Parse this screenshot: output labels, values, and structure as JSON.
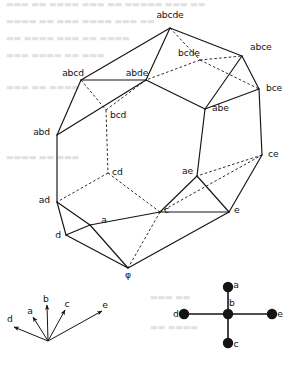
{
  "figure": {
    "name": "graph-associahedron-diagram",
    "caption": "",
    "colors": {
      "ink": "#141414",
      "solid_edge": "#141414",
      "hidden_edge": "#141414",
      "node_fill": "#141414",
      "background": "#ffffff",
      "scan_bleed": "#c9c9c9"
    }
  },
  "polytope": {
    "name": "subset-lattice-polytope",
    "empty_set_symbol": "φ",
    "vertices": [
      {
        "id": "abcde",
        "label": "abcde",
        "x": 170,
        "y": 28,
        "lx": 170,
        "ly": 18,
        "anchor": "middle",
        "hidden": false
      },
      {
        "id": "abce",
        "label": "abce",
        "x": 242,
        "y": 56,
        "lx": 250,
        "ly": 50,
        "anchor": "start",
        "hidden": false
      },
      {
        "id": "bcde",
        "label": "bcde",
        "x": 200,
        "y": 60,
        "lx": 189,
        "ly": 56,
        "anchor": "middle",
        "hidden": true
      },
      {
        "id": "abcd",
        "label": "abcd",
        "x": 81,
        "y": 80,
        "lx": 73,
        "ly": 76,
        "anchor": "middle",
        "hidden": false
      },
      {
        "id": "abde",
        "label": "abde",
        "x": 146,
        "y": 80,
        "lx": 137,
        "ly": 76,
        "anchor": "middle",
        "hidden": false
      },
      {
        "id": "bce",
        "label": "bce",
        "x": 259,
        "y": 89,
        "lx": 266,
        "ly": 91,
        "anchor": "start",
        "hidden": false
      },
      {
        "id": "abe",
        "label": "abe",
        "x": 205,
        "y": 109,
        "lx": 212,
        "ly": 111,
        "anchor": "start",
        "hidden": false
      },
      {
        "id": "bcd",
        "label": "bcd",
        "x": 106,
        "y": 110,
        "lx": 110,
        "ly": 118,
        "anchor": "start",
        "hidden": true
      },
      {
        "id": "abd",
        "label": "abd",
        "x": 57,
        "y": 135,
        "lx": 50,
        "ly": 135,
        "anchor": "end",
        "hidden": false
      },
      {
        "id": "ce",
        "label": "ce",
        "x": 262,
        "y": 155,
        "lx": 268,
        "ly": 157,
        "anchor": "start",
        "hidden": false
      },
      {
        "id": "cd",
        "label": "cd",
        "x": 108,
        "y": 173,
        "lx": 112,
        "ly": 175,
        "anchor": "start",
        "hidden": true
      },
      {
        "id": "ae",
        "label": "ae",
        "x": 197,
        "y": 176,
        "lx": 193,
        "ly": 174,
        "anchor": "end",
        "hidden": false
      },
      {
        "id": "ad",
        "label": "ad",
        "x": 57,
        "y": 202,
        "lx": 50,
        "ly": 203,
        "anchor": "end",
        "hidden": false
      },
      {
        "id": "c",
        "label": "c",
        "x": 160,
        "y": 212,
        "lx": 164,
        "ly": 213,
        "anchor": "start",
        "hidden": false
      },
      {
        "id": "e",
        "label": "e",
        "x": 229,
        "y": 212,
        "lx": 234,
        "ly": 213,
        "anchor": "start",
        "hidden": false
      },
      {
        "id": "a",
        "label": "a",
        "x": 90,
        "y": 225,
        "lx": 104,
        "ly": 223,
        "anchor": "middle",
        "hidden": false
      },
      {
        "id": "d",
        "label": "d",
        "x": 66,
        "y": 235,
        "lx": 61,
        "ly": 238,
        "anchor": "end",
        "hidden": false
      },
      {
        "id": "phi",
        "label": "φ",
        "x": 128,
        "y": 268,
        "lx": 128,
        "ly": 278,
        "anchor": "middle",
        "hidden": false
      }
    ],
    "solid_edges": [
      [
        "abcde",
        "abcd"
      ],
      [
        "abcde",
        "abde"
      ],
      [
        "abcde",
        "abce"
      ],
      [
        "abcd",
        "abde"
      ],
      [
        "abcd",
        "abd"
      ],
      [
        "abde",
        "abd"
      ],
      [
        "abde",
        "abe"
      ],
      [
        "abce",
        "bce"
      ],
      [
        "abce",
        "abe"
      ],
      [
        "abe",
        "bce"
      ],
      [
        "abd",
        "ad"
      ],
      [
        "bce",
        "ce"
      ],
      [
        "abe",
        "ae"
      ],
      [
        "ce",
        "e"
      ],
      [
        "ae",
        "e"
      ],
      [
        "ae",
        "c"
      ],
      [
        "ad",
        "a"
      ],
      [
        "ad",
        "d"
      ],
      [
        "a",
        "d"
      ],
      [
        "a",
        "c"
      ],
      [
        "c",
        "e"
      ],
      [
        "d",
        "phi"
      ],
      [
        "a",
        "phi"
      ],
      [
        "phi",
        "e"
      ]
    ],
    "hidden_edges": [
      [
        "abcde",
        "bcde"
      ],
      [
        "bcde",
        "abce"
      ],
      [
        "bcde",
        "bce"
      ],
      [
        "bcde",
        "abde"
      ],
      [
        "abcd",
        "bcd"
      ],
      [
        "bcd",
        "abde"
      ],
      [
        "bcd",
        "cd"
      ],
      [
        "cd",
        "ad"
      ],
      [
        "cd",
        "c"
      ],
      [
        "c",
        "ce"
      ],
      [
        "ce",
        "ae"
      ],
      [
        "c",
        "phi"
      ]
    ]
  },
  "legend_left": {
    "name": "root-vector-fan",
    "origin": {
      "x": 48,
      "y": 341
    },
    "arrows": [
      {
        "id": "d",
        "label": "d",
        "tip_x": 14,
        "tip_y": 327,
        "lx": 10,
        "ly": 322
      },
      {
        "id": "a",
        "label": "a",
        "tip_x": 33,
        "tip_y": 317,
        "lx": 30,
        "ly": 314
      },
      {
        "id": "b",
        "label": "b",
        "tip_x": 47,
        "tip_y": 305,
        "lx": 46,
        "ly": 302
      },
      {
        "id": "c",
        "label": "c",
        "tip_x": 65,
        "tip_y": 310,
        "lx": 67,
        "ly": 307
      },
      {
        "id": "e",
        "label": "e",
        "tip_x": 102,
        "tip_y": 311,
        "lx": 105,
        "ly": 308
      }
    ]
  },
  "legend_right": {
    "name": "star-graph",
    "center": {
      "id": "b",
      "label": "b",
      "x": 228,
      "y": 314,
      "lx": 232,
      "ly": 306
    },
    "leaves": [
      {
        "id": "a",
        "label": "a",
        "x": 228,
        "y": 287,
        "lx": 236,
        "ly": 288
      },
      {
        "id": "e",
        "label": "e",
        "x": 272,
        "y": 314,
        "lx": 280,
        "ly": 317
      },
      {
        "id": "c",
        "label": "c",
        "x": 228,
        "y": 343,
        "lx": 236,
        "ly": 347
      },
      {
        "id": "d",
        "label": "d",
        "x": 184,
        "y": 314,
        "lx": 176,
        "ly": 317
      }
    ],
    "node_radius": 5.2
  },
  "scan_bleed_lines": [
    {
      "x": 6,
      "y": 7,
      "text": "▬▬▬ ▬▬ ▬▬▬▬ ▬▬▬ ▬▬ ▬▬▬▬▬ ▬▬▬ ▬▬"
    },
    {
      "x": 6,
      "y": 24,
      "text": "▬▬▬▬ ▬▬ ▬▬▬ ▬▬▬▬ ▬▬▬ ▬▬"
    },
    {
      "x": 6,
      "y": 41,
      "text": "▬▬ ▬▬▬▬ ▬▬▬ ▬▬ ▬▬▬▬"
    },
    {
      "x": 6,
      "y": 58,
      "text": "▬▬▬ ▬▬▬▬ ▬▬ ▬▬▬"
    },
    {
      "x": 6,
      "y": 90,
      "text": "▬▬▬ ▬▬ ▬▬▬▬"
    },
    {
      "x": 6,
      "y": 160,
      "text": "▬▬▬▬ ▬▬ ▬▬▬"
    },
    {
      "x": 150,
      "y": 300,
      "text": "▬▬▬ ▬▬"
    },
    {
      "x": 150,
      "y": 330,
      "text": "▬▬ ▬▬▬▬"
    }
  ]
}
